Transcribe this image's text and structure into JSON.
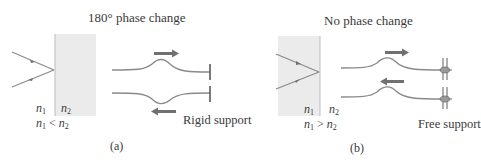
{
  "panels": [
    {
      "id": "a",
      "title": "180° phase change",
      "n1_label": "n",
      "n1_sub": "1",
      "n2_label": "n",
      "n2_sub": "2",
      "relation": "<",
      "support_label": "Rigid support",
      "caption": "(a)"
    },
    {
      "id": "b",
      "title": "No phase change",
      "n1_label": "n",
      "n1_sub": "1",
      "n2_label": "n",
      "n2_sub": "2",
      "relation": ">",
      "support_label": "Free support",
      "caption": "(b)"
    }
  ],
  "colors": {
    "medium_fill": "#ebebeb",
    "ray": "#8a8a8a",
    "string": "#8a8a8a",
    "arrow": "#707070",
    "text": "#3a3a3a"
  }
}
